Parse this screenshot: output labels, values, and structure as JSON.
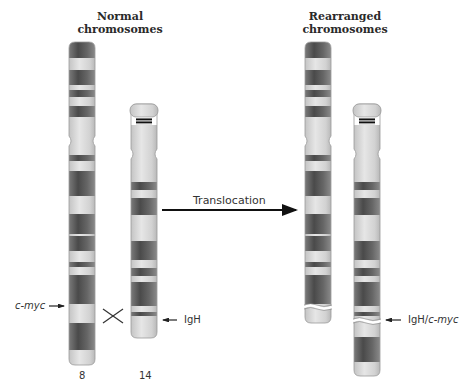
{
  "titles": {
    "normal": [
      "Normal",
      "chromosomes"
    ],
    "rearranged": [
      "Rearranged",
      "chromosomes"
    ]
  },
  "arrow": {
    "label": "Translocation"
  },
  "labels": {
    "cmyc": "c-myc",
    "igh": "IgH",
    "igh_cmyc_prefix": "IgH/",
    "igh_cmyc_suffix": "c-myc",
    "chr8_number": "8",
    "chr14_number": "14"
  },
  "colors": {
    "dark_band": "#5e5e5e",
    "mid_band": "#8a8a8a",
    "light_band": "#d4d4d4",
    "outline": "#9a9a9a",
    "text": "#333333"
  },
  "chromosomes": [
    {
      "id": "chr8-normal",
      "x": 69,
      "width": 26,
      "top": 42,
      "bottom": 365,
      "centromere": 141,
      "bands": [
        [
          42,
          58,
          "dark"
        ],
        [
          58,
          70,
          "light"
        ],
        [
          70,
          85,
          "dark"
        ],
        [
          85,
          90,
          "light"
        ],
        [
          90,
          97,
          "dark"
        ],
        [
          97,
          106,
          "light"
        ],
        [
          106,
          117,
          "dark"
        ],
        [
          117,
          135,
          "light"
        ],
        [
          135,
          148,
          "light"
        ],
        [
          148,
          155,
          "light"
        ],
        [
          155,
          161,
          "dark"
        ],
        [
          161,
          171,
          "light"
        ],
        [
          171,
          196,
          "dark"
        ],
        [
          196,
          214,
          "light"
        ],
        [
          214,
          234,
          "dark"
        ],
        [
          234,
          236,
          "light"
        ],
        [
          236,
          251,
          "dark"
        ],
        [
          251,
          262,
          "light"
        ],
        [
          262,
          267,
          "dark"
        ],
        [
          267,
          275,
          "light"
        ],
        [
          275,
          304,
          "dark"
        ],
        [
          304,
          323,
          "light"
        ],
        [
          323,
          350,
          "dark"
        ],
        [
          350,
          365,
          "light"
        ]
      ]
    },
    {
      "id": "chr14-normal",
      "x": 131,
      "width": 26,
      "top": 104,
      "bottom": 338,
      "centromere": 154,
      "satellite": [
        104,
        117
      ],
      "stalk": [
        117,
        125
      ],
      "bands": [
        [
          125,
          148,
          "light"
        ],
        [
          148,
          160,
          "light"
        ],
        [
          160,
          175,
          "light"
        ],
        [
          175,
          182,
          "light"
        ],
        [
          182,
          190,
          "dark"
        ],
        [
          190,
          198,
          "light"
        ],
        [
          198,
          215,
          "dark"
        ],
        [
          215,
          225,
          "light"
        ],
        [
          225,
          241,
          "light"
        ],
        [
          241,
          260,
          "dark"
        ],
        [
          260,
          262,
          "light"
        ],
        [
          262,
          268,
          "light"
        ],
        [
          268,
          276,
          "dark"
        ],
        [
          276,
          282,
          "light"
        ],
        [
          282,
          306,
          "dark"
        ],
        [
          306,
          312,
          "light"
        ],
        [
          312,
          316,
          "dark"
        ],
        [
          316,
          338,
          "light"
        ]
      ]
    },
    {
      "id": "chr8-rearranged",
      "x": 305,
      "width": 26,
      "top": 42,
      "bottom": 323,
      "centromere": 141,
      "break": 306,
      "bands": [
        [
          42,
          58,
          "dark"
        ],
        [
          58,
          70,
          "light"
        ],
        [
          70,
          85,
          "dark"
        ],
        [
          85,
          90,
          "light"
        ],
        [
          90,
          97,
          "dark"
        ],
        [
          97,
          106,
          "light"
        ],
        [
          106,
          117,
          "dark"
        ],
        [
          117,
          135,
          "light"
        ],
        [
          135,
          148,
          "light"
        ],
        [
          148,
          155,
          "light"
        ],
        [
          155,
          161,
          "dark"
        ],
        [
          161,
          171,
          "light"
        ],
        [
          171,
          196,
          "dark"
        ],
        [
          196,
          214,
          "light"
        ],
        [
          214,
          234,
          "dark"
        ],
        [
          234,
          236,
          "light"
        ],
        [
          236,
          251,
          "dark"
        ],
        [
          251,
          262,
          "light"
        ],
        [
          262,
          267,
          "dark"
        ],
        [
          267,
          275,
          "light"
        ],
        [
          275,
          304,
          "dark"
        ],
        [
          304,
          323,
          "light"
        ]
      ]
    },
    {
      "id": "chr14-rearranged",
      "x": 354,
      "width": 26,
      "top": 104,
      "bottom": 376,
      "centromere": 154,
      "satellite": [
        104,
        117
      ],
      "stalk": [
        117,
        125
      ],
      "break": 320,
      "bands": [
        [
          125,
          148,
          "light"
        ],
        [
          148,
          160,
          "light"
        ],
        [
          160,
          175,
          "light"
        ],
        [
          175,
          182,
          "light"
        ],
        [
          182,
          190,
          "dark"
        ],
        [
          190,
          198,
          "light"
        ],
        [
          198,
          215,
          "dark"
        ],
        [
          215,
          225,
          "light"
        ],
        [
          225,
          241,
          "light"
        ],
        [
          241,
          260,
          "dark"
        ],
        [
          260,
          262,
          "light"
        ],
        [
          262,
          268,
          "light"
        ],
        [
          268,
          276,
          "dark"
        ],
        [
          276,
          282,
          "light"
        ],
        [
          282,
          306,
          "dark"
        ],
        [
          306,
          312,
          "light"
        ],
        [
          312,
          316,
          "dark"
        ],
        [
          316,
          320,
          "light"
        ],
        [
          320,
          337,
          "light"
        ],
        [
          337,
          362,
          "dark"
        ],
        [
          362,
          376,
          "light"
        ]
      ]
    }
  ]
}
